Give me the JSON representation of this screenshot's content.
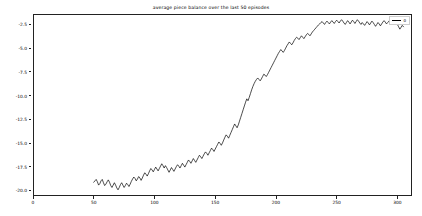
{
  "chart_data": {
    "type": "line",
    "title": "average piece balance over the last 50 episodes",
    "xlabel": "",
    "ylabel": "",
    "xlim": [
      0,
      312
    ],
    "ylim": [
      -20.6,
      -1.4
    ],
    "grid": false,
    "legend_position": "upper right",
    "line_color": "#000000",
    "background_color": "#ffffff",
    "xticks": [
      0,
      50,
      100,
      150,
      200,
      250,
      300
    ],
    "xtick_labels": [
      "0",
      "50",
      "100",
      "150",
      "200",
      "250",
      "300"
    ],
    "yticks": [
      -2.5,
      -5.0,
      -7.5,
      -10.0,
      -12.5,
      -15.0,
      -17.5,
      -20.0
    ],
    "ytick_labels": [
      "-2.5",
      "-5.0",
      "-7.5",
      "-10.0",
      "-12.5",
      "-15.0",
      "-17.5",
      "-20.0"
    ],
    "series": [
      {
        "name": "0",
        "x": [
          50,
          51,
          52,
          53,
          54,
          55,
          56,
          57,
          58,
          59,
          60,
          61,
          62,
          63,
          64,
          65,
          66,
          67,
          68,
          69,
          70,
          71,
          72,
          73,
          74,
          75,
          76,
          77,
          78,
          79,
          80,
          81,
          82,
          83,
          84,
          85,
          86,
          87,
          88,
          89,
          90,
          91,
          92,
          93,
          94,
          95,
          96,
          97,
          98,
          99,
          100,
          101,
          102,
          103,
          104,
          105,
          106,
          107,
          108,
          109,
          110,
          111,
          112,
          113,
          114,
          115,
          116,
          117,
          118,
          119,
          120,
          121,
          122,
          123,
          124,
          125,
          126,
          127,
          128,
          129,
          130,
          131,
          132,
          133,
          134,
          135,
          136,
          137,
          138,
          139,
          140,
          141,
          142,
          143,
          144,
          145,
          146,
          147,
          148,
          149,
          150,
          151,
          152,
          153,
          154,
          155,
          156,
          157,
          158,
          159,
          160,
          161,
          162,
          163,
          164,
          165,
          166,
          167,
          168,
          169,
          170,
          171,
          172,
          173,
          174,
          175,
          176,
          177,
          178,
          179,
          180,
          181,
          182,
          183,
          184,
          185,
          186,
          187,
          188,
          189,
          190,
          191,
          192,
          193,
          194,
          195,
          196,
          197,
          198,
          199,
          200,
          201,
          202,
          203,
          204,
          205,
          206,
          207,
          208,
          209,
          210,
          211,
          212,
          213,
          214,
          215,
          216,
          217,
          218,
          219,
          220,
          221,
          222,
          223,
          224,
          225,
          226,
          227,
          228,
          229,
          230,
          231,
          232,
          233,
          234,
          235,
          236,
          237,
          238,
          239,
          240,
          241,
          242,
          243,
          244,
          245,
          246,
          247,
          248,
          249,
          250,
          251,
          252,
          253,
          254,
          255,
          256,
          257,
          258,
          259,
          260,
          261,
          262,
          263,
          264,
          265,
          266,
          267,
          268,
          269,
          270,
          271,
          272,
          273,
          274,
          275,
          276,
          277,
          278,
          279,
          280,
          281,
          282,
          283,
          284,
          285,
          286,
          287,
          288,
          289,
          290,
          291,
          292,
          293,
          294,
          295,
          296,
          297,
          298,
          299,
          300,
          301,
          302,
          303,
          304,
          305
        ],
        "y": [
          -19.15,
          -19.0,
          -18.85,
          -19.1,
          -19.45,
          -19.3,
          -19.0,
          -18.85,
          -19.2,
          -19.5,
          -19.35,
          -19.1,
          -18.9,
          -19.15,
          -19.5,
          -19.7,
          -19.45,
          -19.2,
          -19.45,
          -19.75,
          -19.95,
          -19.7,
          -19.4,
          -19.2,
          -19.45,
          -19.7,
          -19.5,
          -19.25,
          -19.4,
          -19.6,
          -19.35,
          -19.05,
          -18.8,
          -18.6,
          -18.75,
          -19.0,
          -18.8,
          -18.55,
          -18.7,
          -18.95,
          -18.7,
          -18.4,
          -18.15,
          -18.3,
          -18.5,
          -18.25,
          -17.95,
          -17.7,
          -17.85,
          -18.05,
          -17.8,
          -17.55,
          -17.75,
          -17.95,
          -17.7,
          -17.45,
          -17.2,
          -17.4,
          -17.65,
          -17.4,
          -17.6,
          -17.85,
          -18.1,
          -17.85,
          -17.6,
          -17.8,
          -18.0,
          -17.75,
          -17.5,
          -17.3,
          -17.45,
          -17.65,
          -17.4,
          -17.15,
          -17.35,
          -17.55,
          -17.3,
          -17.05,
          -16.8,
          -16.95,
          -17.15,
          -16.9,
          -16.65,
          -16.85,
          -17.05,
          -16.8,
          -16.55,
          -16.3,
          -16.45,
          -16.65,
          -16.4,
          -16.15,
          -15.95,
          -16.1,
          -16.3,
          -16.05,
          -15.8,
          -15.55,
          -15.7,
          -15.9,
          -15.65,
          -15.4,
          -15.15,
          -14.9,
          -15.05,
          -15.25,
          -15.0,
          -14.7,
          -14.4,
          -14.15,
          -14.3,
          -14.5,
          -14.2,
          -13.9,
          -13.6,
          -13.3,
          -13.0,
          -13.2,
          -13.4,
          -13.1,
          -12.7,
          -12.3,
          -11.9,
          -11.5,
          -11.1,
          -10.7,
          -10.35,
          -10.55,
          -10.2,
          -9.8,
          -9.4,
          -9.05,
          -8.75,
          -8.5,
          -8.3,
          -8.15,
          -8.3,
          -8.45,
          -8.25,
          -8.0,
          -7.75,
          -7.85,
          -8.0,
          -7.8,
          -7.55,
          -7.3,
          -7.05,
          -6.8,
          -6.55,
          -6.3,
          -6.05,
          -5.8,
          -5.55,
          -5.35,
          -5.15,
          -5.3,
          -5.45,
          -5.25,
          -5.0,
          -4.75,
          -4.55,
          -4.35,
          -4.5,
          -4.65,
          -4.45,
          -4.2,
          -4.0,
          -3.85,
          -3.95,
          -4.1,
          -3.9,
          -3.7,
          -3.85,
          -4.0,
          -3.8,
          -3.6,
          -3.45,
          -3.55,
          -3.7,
          -3.5,
          -3.3,
          -3.15,
          -3.0,
          -2.85,
          -2.7,
          -2.55,
          -2.45,
          -2.3,
          -2.2,
          -2.35,
          -2.5,
          -2.3,
          -2.15,
          -2.3,
          -2.45,
          -2.25,
          -2.1,
          -2.25,
          -2.4,
          -2.2,
          -2.05,
          -2.2,
          -2.35,
          -2.15,
          -2.0,
          -2.15,
          -2.35,
          -2.5,
          -2.3,
          -2.1,
          -2.25,
          -2.45,
          -2.25,
          -2.05,
          -2.2,
          -2.4,
          -2.2,
          -2.0,
          -2.15,
          -2.35,
          -2.5,
          -2.3,
          -2.45,
          -2.6,
          -2.4,
          -2.2,
          -2.35,
          -2.55,
          -2.35,
          -2.15,
          -2.3,
          -2.5,
          -2.7,
          -2.5,
          -2.3,
          -2.45,
          -2.65,
          -2.45,
          -2.25,
          -2.1,
          -2.25,
          -2.45,
          -2.3,
          -2.15,
          -2.0,
          -1.9,
          -2.05,
          -2.25,
          -2.45,
          -2.3,
          -2.5,
          -2.75,
          -3.0,
          -2.8,
          -2.6,
          -2.75
        ]
      }
    ]
  }
}
